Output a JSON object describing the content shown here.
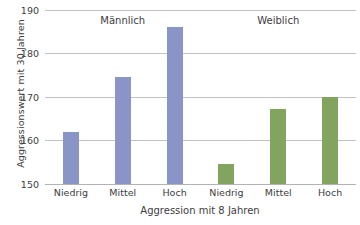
{
  "chart_data": {
    "type": "bar",
    "title": "",
    "xlabel": "Aggression mit 8 Jahren",
    "ylabel": "Aggressionswert mit 30 Jahren",
    "ylim": [
      150,
      190
    ],
    "yticks": [
      150,
      160,
      170,
      180,
      190
    ],
    "grid": true,
    "legend": "none",
    "categories": [
      "Niedrig",
      "Mittel",
      "Hoch",
      "Niedrig",
      "Mittel",
      "Hoch"
    ],
    "values": [
      161.9,
      174.6,
      186.2,
      154.6,
      167.2,
      170.1
    ],
    "group_labels": [
      "Männlich",
      "Weiblich"
    ],
    "groups": [
      {
        "name": "Männlich",
        "color": "#8995c6",
        "categories": [
          "Niedrig",
          "Mittel",
          "Hoch"
        ],
        "values": [
          161.9,
          174.6,
          186.2
        ]
      },
      {
        "name": "Weiblich",
        "color": "#83a45f",
        "categories": [
          "Niedrig",
          "Mittel",
          "Hoch"
        ],
        "values": [
          154.6,
          167.2,
          170.1
        ]
      }
    ],
    "bars": [
      {
        "label": "Niedrig",
        "group": "Männlich",
        "value": 161.9,
        "color": "#8995c6"
      },
      {
        "label": "Mittel",
        "group": "Männlich",
        "value": 174.6,
        "color": "#8995c6"
      },
      {
        "label": "Hoch",
        "group": "Männlich",
        "value": 186.2,
        "color": "#8995c6"
      },
      {
        "label": "Niedrig",
        "group": "Weiblich",
        "value": 154.6,
        "color": "#83a45f"
      },
      {
        "label": "Mittel",
        "group": "Weiblich",
        "value": 167.2,
        "color": "#83a45f"
      },
      {
        "label": "Hoch",
        "group": "Weiblich",
        "value": 170.1,
        "color": "#83a45f"
      }
    ]
  },
  "axis": {
    "y_tick_0": "150",
    "y_tick_1": "160",
    "y_tick_2": "170",
    "y_tick_3": "180",
    "y_tick_4": "190"
  }
}
